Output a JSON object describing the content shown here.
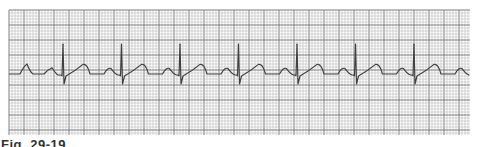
{
  "caption": "Fig. 29-19",
  "chart_data": {
    "type": "line",
    "title": "",
    "grid": true,
    "grid_small_box_ms": 40,
    "grid_large_box_ms": 200,
    "rhythm": {
      "r_wave_count": 8,
      "rr_interval_small_boxes": 19.5,
      "beats": [
        {
          "index": 1
        },
        {
          "index": 2
        },
        {
          "index": 3
        },
        {
          "index": 4
        },
        {
          "index": 5
        },
        {
          "index": 6
        },
        {
          "index": 7
        },
        {
          "index": 8
        }
      ],
      "complex_shape": {
        "q_depth_mv": 0.2,
        "r_height_mv": 1.0,
        "s_depth_mv": 0.2,
        "t_height_mv": 0.4,
        "p_height_mv": 0.3
      }
    },
    "colors": {
      "grid_minor": "#b8b8b8",
      "grid_major": "#707070",
      "trace": "#404040"
    }
  }
}
